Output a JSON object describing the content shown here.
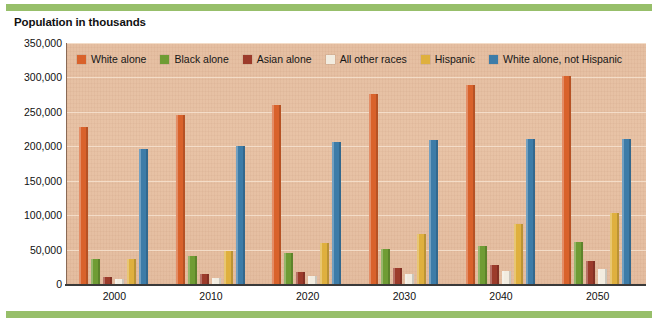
{
  "title": "Population in thousands",
  "colors": {
    "accent_rule": "#97bf6a",
    "plot_background": "#e6c0a3",
    "gridline": "#f6e2cf",
    "axis": "#3a3a3a"
  },
  "chart_data": {
    "type": "bar",
    "title": "Population in thousands",
    "xlabel": "",
    "ylabel": "Population in thousands",
    "categories": [
      "2000",
      "2010",
      "2020",
      "2030",
      "2040",
      "2050"
    ],
    "ylim": [
      0,
      350000
    ],
    "yticks": [
      0,
      50000,
      100000,
      150000,
      200000,
      250000,
      300000,
      350000
    ],
    "ytick_labels": [
      "0",
      "50,000",
      "100,000",
      "150,000",
      "200,000",
      "250,000",
      "300,000",
      "350,000"
    ],
    "grid": true,
    "legend_position": "top-inside",
    "series": [
      {
        "name": "White alone",
        "color": "#d9622b",
        "values": [
          228548,
          244995,
          260629,
          275731,
          289690,
          302626
        ]
      },
      {
        "name": "Black alone",
        "color": "#6f9c34",
        "values": [
          35818,
          40454,
          45365,
          50442,
          55876,
          61361
        ]
      },
      {
        "name": "Asian alone",
        "color": "#9c3b2b",
        "values": [
          10684,
          14241,
          17988,
          22580,
          27992,
          33430
        ]
      },
      {
        "name": "All other races",
        "color": "#f2ece0",
        "values": [
          7075,
          9246,
          11822,
          14831,
          18336,
          22437
        ]
      },
      {
        "name": "Hispanic",
        "color": "#dfb03e",
        "values": [
          35622,
          47756,
          59756,
          73055,
          87585,
          102560
        ]
      },
      {
        "name": "White alone, not Hispanic",
        "color": "#3d7ca8",
        "values": [
          195729,
          201112,
          205936,
          209176,
          210331,
          210283
        ]
      }
    ]
  }
}
